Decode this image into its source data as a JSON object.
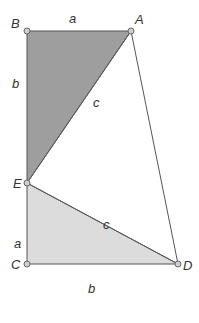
{
  "diagram": {
    "colors": {
      "dark_triangle_fill": "#9e9e9e",
      "light_triangle_fill": "#dcdcdc",
      "stroke": "#555555",
      "point_fill": "#cfcfcf"
    },
    "points": {
      "A": {
        "label": "A",
        "x": 131,
        "y": 31
      },
      "B": {
        "label": "B",
        "x": 27,
        "y": 31
      },
      "C": {
        "label": "C",
        "x": 27,
        "y": 264
      },
      "D": {
        "label": "D",
        "x": 178,
        "y": 264
      },
      "E": {
        "label": "E",
        "x": 27,
        "y": 183
      }
    },
    "edge_labels": {
      "BA": "a",
      "BE": "b",
      "EA": "c",
      "EC": "a",
      "ED": "c",
      "CD": "b"
    }
  }
}
